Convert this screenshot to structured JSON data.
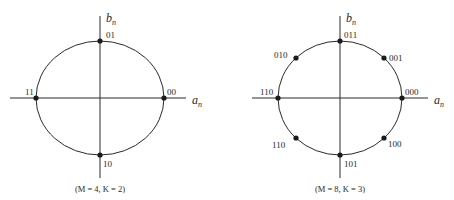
{
  "diagrams": [
    {
      "id": "qpsk",
      "caption": "(M = 4, K = 2)",
      "x_axis_label": "a",
      "x_axis_sub": "n",
      "y_axis_label": "b",
      "y_axis_sub": "n",
      "points": [
        {
          "label": "00",
          "angle_deg": 0
        },
        {
          "label": "01",
          "angle_deg": 90
        },
        {
          "label": "11",
          "angle_deg": 180
        },
        {
          "label": "10",
          "angle_deg": 270
        }
      ]
    },
    {
      "id": "8psk",
      "caption": "(M = 8, K = 3)",
      "x_axis_label": "a",
      "x_axis_sub": "n",
      "y_axis_label": "b",
      "y_axis_sub": "n",
      "points": [
        {
          "label": "000",
          "angle_deg": 0
        },
        {
          "label": "001",
          "angle_deg": 45
        },
        {
          "label": "011",
          "angle_deg": 90
        },
        {
          "label": "010",
          "angle_deg": 135
        },
        {
          "label": "110",
          "angle_deg": 180
        },
        {
          "label": "110",
          "angle_deg": 225
        },
        {
          "label": "101",
          "angle_deg": 270
        },
        {
          "label": "100",
          "angle_deg": 315
        }
      ]
    }
  ],
  "colors": {
    "line": "#2a2a2a",
    "dot": "#1a1a1a",
    "background": "#ffffff"
  }
}
